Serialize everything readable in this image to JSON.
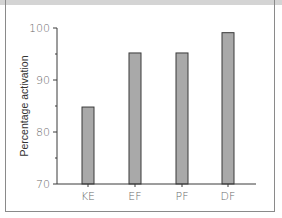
{
  "chart_data": {
    "type": "bar",
    "title": "",
    "xlabel": "",
    "ylabel": "Percentage activation",
    "categories": [
      "KE",
      "EF",
      "PF",
      "DF"
    ],
    "values": [
      84.8,
      95.2,
      95.2,
      99.1
    ],
    "ylim": [
      70,
      100
    ],
    "yticks": [
      70,
      80,
      90,
      100
    ],
    "minor_yticks": [
      75,
      85,
      95
    ],
    "grid": false,
    "legend": null,
    "bar_color": "#a9a9a9",
    "bar_edge_color": "#3a3a3a"
  },
  "axis": {
    "y_tick_labels": [
      "70",
      "80",
      "90",
      "100"
    ]
  }
}
